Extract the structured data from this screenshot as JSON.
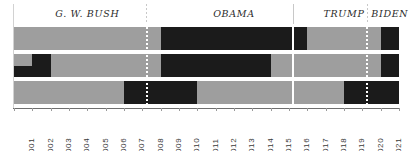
{
  "chart_data": {
    "type": "heatmap",
    "title": "",
    "xlabel": "",
    "ylabel": "",
    "x_axis_label_orientation": "vertical",
    "grid": false,
    "legend": "none",
    "colors": {
      "on": "#1b1b1b",
      "off": "#9e9e9e",
      "background": "#ffffff",
      "axis": "#6e6e6e",
      "divider": "#c8c8c8",
      "text": "#2b2b2b"
    },
    "categories": [
      "2001",
      "2002",
      "2003",
      "2004",
      "2005",
      "2006",
      "2007",
      "2008",
      "2009",
      "2010",
      "2011",
      "2012",
      "2013",
      "2014",
      "2015",
      "2016",
      "2017",
      "2018",
      "2019",
      "2020",
      "2021"
    ],
    "x_start": 2001,
    "x_end": 2021,
    "presidents": [
      {
        "name": "G. W. BUSH",
        "start": 2001,
        "end": 2009,
        "divider_after": "dotted"
      },
      {
        "name": "OBAMA",
        "start": 2009,
        "end": 2017,
        "divider_after": "solid"
      },
      {
        "name": "TRUMP",
        "start": 2017,
        "end": 2021,
        "divider_after": "dotted"
      },
      {
        "name": "BIDEN",
        "start": 2021,
        "end": 2022,
        "divider_after": "none"
      }
    ],
    "rows": [
      {
        "name": "row-1",
        "segments": [
          {
            "start": 2001,
            "end": 2009,
            "state": "off"
          },
          {
            "start": 2009,
            "end": 2017,
            "state": "on"
          },
          {
            "start": 2017,
            "end": 2021,
            "state": "off"
          },
          {
            "start": 2021,
            "end": 2022,
            "state": "on"
          }
        ]
      },
      {
        "name": "row-2",
        "segments": [
          {
            "start": 2001,
            "end": 2001.5,
            "state": "off"
          },
          {
            "start": 2001.5,
            "end": 2003,
            "state": "on",
            "split": "half-lower-2001"
          },
          {
            "start": 2003,
            "end": 2009,
            "state": "off"
          },
          {
            "start": 2009,
            "end": 2015,
            "state": "on"
          },
          {
            "start": 2015,
            "end": 2021,
            "state": "off"
          },
          {
            "start": 2021,
            "end": 2022,
            "state": "on"
          }
        ]
      },
      {
        "name": "row-3",
        "segments": [
          {
            "start": 2001,
            "end": 2007,
            "state": "off"
          },
          {
            "start": 2007,
            "end": 2011,
            "state": "on"
          },
          {
            "start": 2011,
            "end": 2019,
            "state": "off"
          },
          {
            "start": 2019,
            "end": 2022,
            "state": "on"
          }
        ]
      }
    ]
  },
  "presidents": [
    {
      "label": "G. W. BUSH"
    },
    {
      "label": "OBAMA"
    },
    {
      "label": "TRUMP"
    },
    {
      "label": "BIDEN"
    }
  ],
  "years": [
    "2001",
    "2002",
    "2003",
    "2004",
    "2005",
    "2006",
    "2007",
    "2008",
    "2009",
    "2010",
    "2011",
    "2012",
    "2013",
    "2014",
    "2015",
    "2016",
    "2017",
    "2018",
    "2019",
    "2020",
    "2021"
  ]
}
